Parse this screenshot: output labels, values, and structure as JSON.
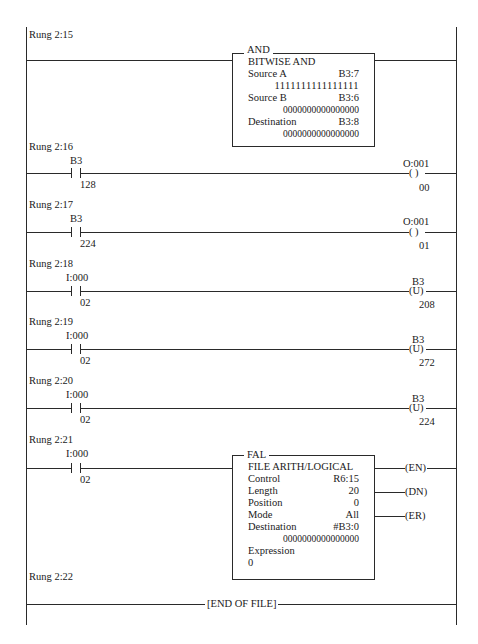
{
  "diagram": {
    "type": "ladder-logic",
    "rails": {
      "left_x": 26,
      "right_x": 457
    }
  },
  "rungs": [
    {
      "label": "Rung 2:15",
      "instruction": {
        "type": "AND",
        "title": "AND",
        "subtitle": "BITWISE AND",
        "source_a_label": "Source A",
        "source_a_addr": "B3:7",
        "source_a_value": "1111111111111111",
        "source_b_label": "Source B",
        "source_b_addr": "B3:6",
        "source_b_value": "0000000000000000",
        "dest_label": "Destination",
        "dest_addr": "B3:8",
        "dest_value": "0000000000000000"
      }
    },
    {
      "label": "Rung 2:16",
      "contact": {
        "addr": "B3",
        "bit": "128"
      },
      "output": {
        "type": "OTE",
        "addr": "O:001",
        "symbol": "( )",
        "bit": "00"
      }
    },
    {
      "label": "Rung 2:17",
      "contact": {
        "addr": "B3",
        "bit": "224"
      },
      "output": {
        "type": "OTE",
        "addr": "O:001",
        "symbol": "( )",
        "bit": "01"
      }
    },
    {
      "label": "Rung 2:18",
      "contact": {
        "addr": "I:000",
        "bit": "02"
      },
      "output": {
        "type": "OTU",
        "addr": "B3",
        "symbol": "(U)",
        "bit": "208"
      }
    },
    {
      "label": "Rung 2:19",
      "contact": {
        "addr": "I:000",
        "bit": "02"
      },
      "output": {
        "type": "OTU",
        "addr": "B3",
        "symbol": "(U)",
        "bit": "272"
      }
    },
    {
      "label": "Rung 2:20",
      "contact": {
        "addr": "I:000",
        "bit": "02"
      },
      "output": {
        "type": "OTU",
        "addr": "B3",
        "symbol": "(U)",
        "bit": "224"
      }
    },
    {
      "label": "Rung 2:21",
      "contact": {
        "addr": "I:000",
        "bit": "02"
      },
      "instruction": {
        "type": "FAL",
        "title": "FAL",
        "subtitle": "FILE ARITH/LOGICAL",
        "control_label": "Control",
        "control_value": "R6:15",
        "length_label": "Length",
        "length_value": "20",
        "position_label": "Position",
        "position_value": "0",
        "mode_label": "Mode",
        "mode_value": "All",
        "dest_label": "Destination",
        "dest_addr": "#B3:0",
        "dest_value": "0000000000000000",
        "expr_label": "Expression",
        "expr_value": "0"
      },
      "outputs": {
        "en": "(EN)",
        "dn": "(DN)",
        "er": "(ER)"
      }
    },
    {
      "label": "Rung 2:22",
      "end_label": "[END OF FILE]"
    }
  ]
}
